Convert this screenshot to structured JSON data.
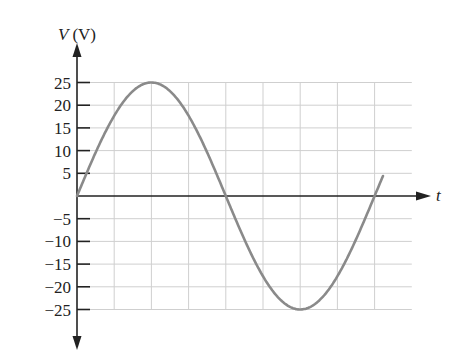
{
  "chart_data": {
    "type": "line",
    "title": "",
    "xlabel": "t",
    "ylabel": "V (V)",
    "ylabel_parts": {
      "var": "V",
      "unit": "(V)"
    },
    "yticks": [
      25,
      20,
      15,
      10,
      5,
      -5,
      -10,
      -15,
      -20,
      -25
    ],
    "ytick_labels": [
      "25",
      "20",
      "15",
      "10",
      "5",
      "−5",
      "−10",
      "−15",
      "−20",
      "−25"
    ],
    "ylim": [
      -25,
      25
    ],
    "grid": true,
    "x_grid_cells": 9,
    "series": [
      {
        "name": "V(t)",
        "function": "sine",
        "amplitude": 25,
        "period_grid_cells": 8,
        "phase": 0,
        "extends_grid_cells": 8.25,
        "color": "#8a8a8a",
        "key_points": [
          {
            "x_cell": 0,
            "y": 0
          },
          {
            "x_cell": 2,
            "y": 25
          },
          {
            "x_cell": 4,
            "y": 0
          },
          {
            "x_cell": 6,
            "y": -25
          },
          {
            "x_cell": 8,
            "y": 0
          }
        ]
      }
    ]
  }
}
